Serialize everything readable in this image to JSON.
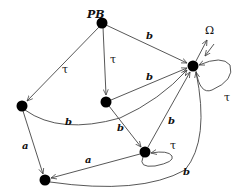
{
  "diagram": {
    "type": "state-transition-graph",
    "nodes": [
      {
        "id": "PB",
        "label": "PB",
        "x": 102,
        "y": 23
      },
      {
        "id": "omega",
        "label": "",
        "x": 193,
        "y": 66
      },
      {
        "id": "left",
        "label": "",
        "x": 22,
        "y": 106
      },
      {
        "id": "middle",
        "label": "",
        "x": 106,
        "y": 102
      },
      {
        "id": "loop",
        "label": "",
        "x": 145,
        "y": 152
      },
      {
        "id": "bottom",
        "label": "",
        "x": 45,
        "y": 180
      }
    ],
    "edges": [
      {
        "from": "PB",
        "to": "left",
        "label": "τ"
      },
      {
        "from": "PB",
        "to": "middle",
        "label": "τ"
      },
      {
        "from": "PB",
        "to": "omega",
        "label": "b"
      },
      {
        "from": "middle",
        "to": "omega",
        "label": "b"
      },
      {
        "from": "left",
        "to": "omega",
        "label": "b"
      },
      {
        "from": "middle",
        "to": "loop",
        "label": "b"
      },
      {
        "from": "loop",
        "to": "omega",
        "label": "b"
      },
      {
        "from": "left",
        "to": "bottom",
        "label": "a"
      },
      {
        "from": "loop",
        "to": "bottom",
        "label": "a"
      },
      {
        "from": "bottom",
        "to": "omega",
        "label": "b"
      },
      {
        "from": "loop",
        "to": "loop",
        "label": "τ"
      },
      {
        "from": "omega",
        "to": "omega",
        "label": "τ"
      }
    ],
    "omega_label": "Ω",
    "labels": {
      "pb": "PB",
      "omega": "Ω",
      "tau_pb_left": "τ",
      "tau_pb_mid": "τ",
      "b_pb_omega": "b",
      "b_mid_omega": "b",
      "b_left_omega": "b",
      "b_mid_loop": "b",
      "b_loop_omega": "b",
      "a_left_bottom": "a",
      "a_loop_bottom": "a",
      "b_bottom_omega": "b",
      "tau_loop_self": "τ",
      "tau_omega_self": "τ"
    }
  }
}
